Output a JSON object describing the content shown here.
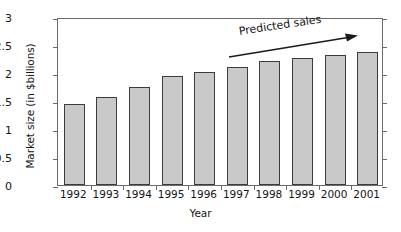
{
  "chart_data": {
    "type": "bar",
    "title": "",
    "subtitle": "",
    "xlabel": "Year",
    "ylabel": "Market size (in $billions)",
    "categories": [
      "1992",
      "1993",
      "1994",
      "1995",
      "1996",
      "1997",
      "1998",
      "1999",
      "2000",
      "2001"
    ],
    "values": [
      1.45,
      1.57,
      1.75,
      1.95,
      2.02,
      2.11,
      2.21,
      2.27,
      2.32,
      2.37
    ],
    "ylim": [
      0,
      3
    ],
    "yticks": [
      "0",
      "0.5",
      "1",
      "1.5",
      "2",
      "2.5",
      "3"
    ],
    "ytick_values": [
      0,
      0.5,
      1,
      1.5,
      2,
      2.5,
      3
    ],
    "grid": false,
    "legend": null,
    "annotations": [
      {
        "text": "Predicted sales",
        "kind": "arrow-label",
        "arrow_direction": "right-up",
        "covers_categories": [
          "1997",
          "1998",
          "1999",
          "2000",
          "2001"
        ]
      }
    ],
    "colors": {
      "bar_fill": "#c9c9c9",
      "bar_stroke": "#3c3c3c",
      "axis": "#6b6b6b",
      "text": "#141414",
      "background": "#ffffff"
    }
  }
}
